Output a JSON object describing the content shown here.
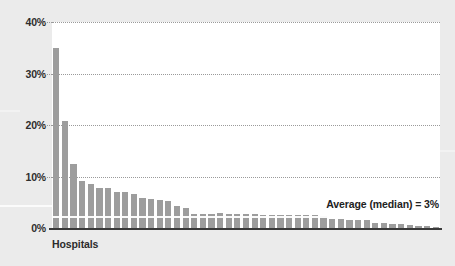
{
  "figure": {
    "background_color": "#ebebeb",
    "plot_background_color": "#ffffff",
    "bar_color": "#9d9d9d",
    "gridline_color": "#9a9a9a",
    "axis_color": "#3a3a3a",
    "text_color": "#2b2b2b"
  },
  "axis": {
    "x_title": "Hospitals",
    "y_ticks": [
      "40%",
      "30%",
      "20%",
      "10%",
      "0%"
    ]
  },
  "annotation": {
    "average_label": "Average (median) = 3%"
  },
  "chart_data": {
    "type": "bar",
    "title": "",
    "subtitle": "",
    "xlabel": "Hospitals",
    "ylabel": "",
    "ylim": [
      0,
      40
    ],
    "ytick_values": [
      0,
      10,
      20,
      30,
      40
    ],
    "ytick_labels": [
      "0%",
      "10%",
      "20%",
      "30%",
      "40%"
    ],
    "grid": true,
    "legend": "none",
    "annotations": [
      {
        "text": "Average (median) = 3%",
        "position": "upper-right-inside",
        "value": 3
      }
    ],
    "units": "percent",
    "sorted": "descending",
    "categories": [
      "Hospital 1",
      "Hospital 2",
      "Hospital 3",
      "Hospital 4",
      "Hospital 5",
      "Hospital 6",
      "Hospital 7",
      "Hospital 8",
      "Hospital 9",
      "Hospital 10",
      "Hospital 11",
      "Hospital 12",
      "Hospital 13",
      "Hospital 14",
      "Hospital 15",
      "Hospital 16",
      "Hospital 17",
      "Hospital 18",
      "Hospital 19",
      "Hospital 20",
      "Hospital 21",
      "Hospital 22",
      "Hospital 23",
      "Hospital 24",
      "Hospital 25",
      "Hospital 26",
      "Hospital 27",
      "Hospital 28",
      "Hospital 29",
      "Hospital 30",
      "Hospital 31",
      "Hospital 32",
      "Hospital 33",
      "Hospital 34",
      "Hospital 35",
      "Hospital 36",
      "Hospital 37",
      "Hospital 38",
      "Hospital 39",
      "Hospital 40",
      "Hospital 41",
      "Hospital 42",
      "Hospital 43",
      "Hospital 44",
      "Hospital 45"
    ],
    "values": [
      35.0,
      20.8,
      12.5,
      9.2,
      8.5,
      7.7,
      7.7,
      7.0,
      7.0,
      6.7,
      5.9,
      5.6,
      5.5,
      5.3,
      4.3,
      3.9,
      2.7,
      2.7,
      2.8,
      2.9,
      2.7,
      2.7,
      2.7,
      2.7,
      2.6,
      2.6,
      2.6,
      2.5,
      2.5,
      2.5,
      2.5,
      2.4,
      1.8,
      1.7,
      1.6,
      1.6,
      1.5,
      1.0,
      0.9,
      0.8,
      0.7,
      0.5,
      0.4,
      0.3,
      0.2
    ]
  }
}
